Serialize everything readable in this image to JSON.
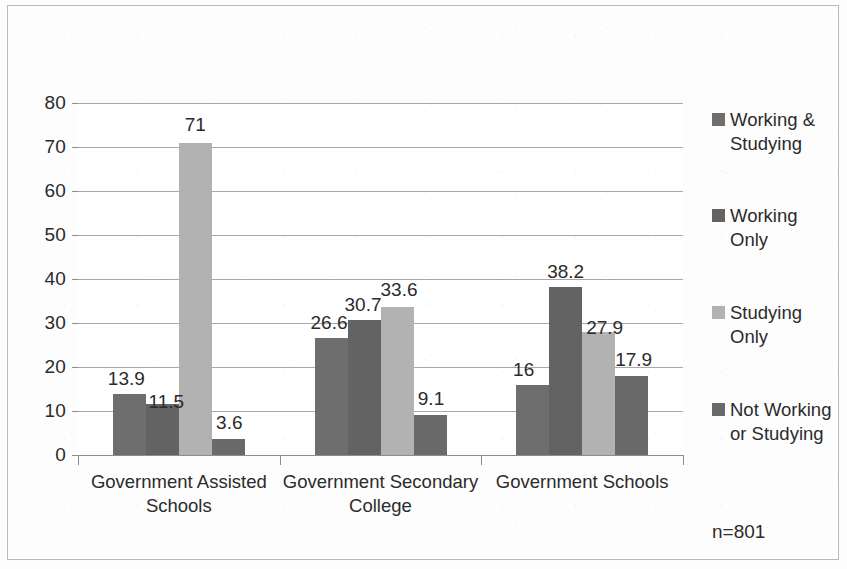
{
  "chart_data": {
    "type": "bar",
    "title": "",
    "subtitle": "",
    "xlabel": "",
    "ylabel": "",
    "ylim": [
      0,
      80
    ],
    "ytick_step": 10,
    "yticks": [
      "0",
      "10",
      "20",
      "30",
      "40",
      "50",
      "60",
      "70",
      "80"
    ],
    "grid": true,
    "grid_axis": "y",
    "legend_position": "right",
    "grouping": "grouped",
    "annotation": "n=801",
    "categories": [
      "Government Assisted Schools",
      "Government Secondary College",
      "Government Schools"
    ],
    "series": [
      {
        "name": "Working & Studying",
        "color": "#6e6e6e",
        "values": [
          13.9,
          26.6,
          16
        ],
        "labels": [
          "13.9",
          "26.6",
          "16"
        ]
      },
      {
        "name": "Working Only",
        "color": "#636363",
        "values": [
          11.5,
          30.7,
          38.2
        ],
        "labels": [
          "11.5",
          "30.7",
          "38.2"
        ]
      },
      {
        "name": "Studying Only",
        "color": "#b2b2b2",
        "values": [
          71,
          33.6,
          27.9
        ],
        "labels": [
          "71",
          "33.6",
          "27.9"
        ]
      },
      {
        "name": "Not Working or Studying",
        "color": "#6a6a6a",
        "values": [
          3.6,
          9.1,
          17.9
        ],
        "labels": [
          "3.6",
          "9.1",
          "17.9"
        ]
      }
    ]
  },
  "legend": {
    "items": [
      {
        "label": "Working & Studying",
        "color": "#6e6e6e"
      },
      {
        "label": "Working Only",
        "color": "#636363"
      },
      {
        "label": "Studying Only",
        "color": "#b2b2b2"
      },
      {
        "label": "Not Working or Studying",
        "color": "#6a6a6a"
      }
    ]
  },
  "footnote": {
    "sample_size": "n=801"
  },
  "style": {
    "axis_color": "#8d8d8d",
    "grid_color": "#a8a8a8",
    "text_color": "#2b2b2b",
    "background": "#fdfdfd",
    "frame_color": "#b9b9b9"
  }
}
